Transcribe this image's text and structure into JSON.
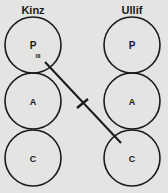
{
  "diagram": {
    "left": {
      "name": "Kinz",
      "states": [
        "P",
        "A",
        "C"
      ],
      "subscript": "III"
    },
    "right": {
      "name": "Ullif",
      "states": [
        "P",
        "A",
        "C"
      ]
    },
    "transaction": {
      "from": "Kinz P (III)",
      "to": "Ullif C",
      "crossed": true
    },
    "colors": {
      "background": "#e4e4e2",
      "ink": "#1a1a1a"
    }
  }
}
